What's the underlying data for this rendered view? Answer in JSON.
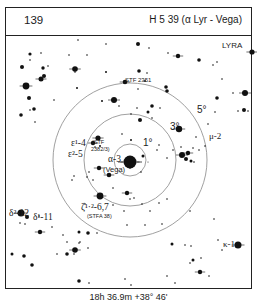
{
  "header": {
    "chart_number": "139",
    "title": "H 5 39 (α Lyr - Vega)"
  },
  "map": {
    "constellation": "LYRA",
    "center": {
      "x": 130,
      "y": 160
    },
    "rings": [
      {
        "label": "1°",
        "radius": 16,
        "label_x": 143,
        "label_y": 146
      },
      {
        "label": "3°",
        "radius": 46,
        "label_x": 170,
        "label_y": 130
      },
      {
        "label": "5°",
        "radius": 77,
        "label_x": 197,
        "label_y": 113
      }
    ],
    "labels": [
      {
        "id": "alpha",
        "text": "α-3",
        "x": 108,
        "y": 162
      },
      {
        "id": "vega",
        "text": "(Vega)",
        "x": 103,
        "y": 172
      },
      {
        "id": "stf2351",
        "text": "STF 2351",
        "x": 125,
        "y": 82
      },
      {
        "id": "eps1",
        "text": "ε¹-4",
        "x": 71,
        "y": 146
      },
      {
        "id": "eps2",
        "text": "ε²-5",
        "x": 68,
        "y": 157
      },
      {
        "id": "stf2382",
        "text": "(STF",
        "x": 92,
        "y": 144
      },
      {
        "id": "stf2382b",
        "text": "2382/3)",
        "x": 91,
        "y": 151
      },
      {
        "id": "zeta",
        "text": "ζ¹·²-6,7",
        "x": 81,
        "y": 210
      },
      {
        "id": "stfa38",
        "text": "(STFA 38)",
        "x": 87,
        "y": 218
      },
      {
        "id": "delta2",
        "text": "δ²-12",
        "x": 9,
        "y": 216
      },
      {
        "id": "delta1",
        "text": "δ¹-11",
        "x": 33,
        "y": 220
      },
      {
        "id": "mu",
        "text": "μ-2",
        "x": 209,
        "y": 139
      },
      {
        "id": "kappa",
        "text": "κ-1",
        "x": 223,
        "y": 247
      }
    ],
    "stars": [
      [
        30,
        54,
        1.6
      ],
      [
        22,
        67,
        2
      ],
      [
        43,
        68,
        1.7
      ],
      [
        30,
        60,
        0.8
      ],
      [
        41,
        53,
        0.8
      ],
      [
        48,
        66,
        0.8
      ],
      [
        26,
        86,
        3.4
      ],
      [
        41,
        79,
        2.5
      ],
      [
        44,
        76,
        2
      ],
      [
        29,
        98,
        2
      ],
      [
        34,
        109,
        1.8
      ],
      [
        54,
        100,
        0.8
      ],
      [
        30,
        110,
        0.8
      ],
      [
        21,
        115,
        1.8
      ],
      [
        35,
        122,
        0.8
      ],
      [
        69,
        55,
        0.8
      ],
      [
        75,
        69,
        2.8
      ],
      [
        75,
        72,
        0.8
      ],
      [
        87,
        55,
        0.8
      ],
      [
        106,
        44,
        0.8
      ],
      [
        77,
        88,
        1
      ],
      [
        106,
        72,
        1
      ],
      [
        102,
        101,
        1
      ],
      [
        78,
        40,
        0.8
      ],
      [
        138,
        44,
        2
      ],
      [
        149,
        48,
        0.8
      ],
      [
        168,
        53,
        0.8
      ],
      [
        178,
        56,
        2.2
      ],
      [
        177,
        56,
        0.8
      ],
      [
        139,
        71,
        1.8
      ],
      [
        147,
        73,
        0.8
      ],
      [
        145,
        81,
        1
      ],
      [
        125,
        82,
        2.3
      ],
      [
        166,
        87,
        1.8
      ],
      [
        167,
        91,
        1.8
      ],
      [
        114,
        100,
        3
      ],
      [
        119,
        106,
        0.8
      ],
      [
        138,
        89,
        0.8
      ],
      [
        152,
        106,
        1.8
      ],
      [
        160,
        108,
        0.8
      ],
      [
        137,
        108,
        0.8
      ],
      [
        148,
        112,
        1.5
      ],
      [
        152,
        118,
        0.8
      ],
      [
        199,
        60,
        1.8
      ],
      [
        213,
        65,
        0.8
      ],
      [
        222,
        79,
        0.8
      ],
      [
        217,
        62,
        0.8
      ],
      [
        217,
        98,
        1.8
      ],
      [
        233,
        93,
        0.8
      ],
      [
        245,
        93,
        3
      ],
      [
        238,
        111,
        0.8
      ],
      [
        244,
        110,
        2
      ],
      [
        248,
        111,
        0.8
      ],
      [
        215,
        112,
        0.8
      ],
      [
        208,
        124,
        0.8
      ],
      [
        252,
        52,
        2.6
      ],
      [
        98,
        138,
        2.6
      ],
      [
        93,
        143,
        2.2
      ],
      [
        100,
        146,
        1
      ],
      [
        95,
        147,
        0.8
      ],
      [
        99,
        168,
        2.2
      ],
      [
        93,
        180,
        0.8
      ],
      [
        122,
        134,
        0.8
      ],
      [
        140,
        120,
        2
      ],
      [
        131,
        114,
        0.8
      ],
      [
        131,
        140,
        1
      ],
      [
        143,
        156,
        1.5
      ],
      [
        130,
        162,
        6.5
      ],
      [
        130,
        168,
        0.8
      ],
      [
        148,
        162,
        0.5
      ],
      [
        141,
        172,
        0.8
      ],
      [
        109,
        175,
        2.3
      ],
      [
        89,
        172,
        0.8
      ],
      [
        87,
        177,
        0.8
      ],
      [
        74,
        176,
        0.8
      ],
      [
        72,
        180,
        0.8
      ],
      [
        113,
        188,
        0.8
      ],
      [
        127,
        193,
        2.2
      ],
      [
        130,
        199,
        0.8
      ],
      [
        134,
        198,
        0.8
      ],
      [
        142,
        204,
        0.8
      ],
      [
        113,
        205,
        0.8
      ],
      [
        124,
        211,
        0.8
      ],
      [
        150,
        211,
        0.8
      ],
      [
        127,
        225,
        0.8
      ],
      [
        145,
        225,
        0.8
      ],
      [
        159,
        145,
        0.8
      ],
      [
        157,
        150,
        0.8
      ],
      [
        167,
        158,
        0.8
      ],
      [
        159,
        203,
        0.8
      ],
      [
        167,
        199,
        0.8
      ],
      [
        190,
        211,
        0.8
      ],
      [
        179,
        129,
        3.2
      ],
      [
        196,
        137,
        0.8
      ],
      [
        188,
        153,
        2.2
      ],
      [
        182,
        155,
        3
      ],
      [
        186,
        159,
        2
      ],
      [
        191,
        161,
        1.5
      ],
      [
        194,
        162,
        0.8
      ],
      [
        199,
        150,
        0.8
      ],
      [
        205,
        146,
        0.8
      ],
      [
        181,
        147,
        0.8
      ],
      [
        173,
        150,
        0.8
      ],
      [
        193,
        148,
        0.8
      ],
      [
        100,
        196,
        3.4
      ],
      [
        85,
        204,
        0.8
      ],
      [
        162,
        224,
        0.8
      ],
      [
        172,
        244,
        1.5
      ],
      [
        185,
        245,
        0.8
      ],
      [
        191,
        246,
        0.8
      ],
      [
        193,
        260,
        1.5
      ],
      [
        201,
        258,
        0.8
      ],
      [
        200,
        272,
        2.2
      ],
      [
        209,
        276,
        0.8
      ],
      [
        175,
        283,
        0.8
      ],
      [
        214,
        219,
        0.8
      ],
      [
        218,
        240,
        0.8
      ],
      [
        238,
        245,
        3.5
      ],
      [
        222,
        250,
        0.8
      ],
      [
        21,
        213,
        3.5
      ],
      [
        27,
        217,
        2
      ],
      [
        20,
        223,
        0.8
      ],
      [
        25,
        224,
        0.8
      ],
      [
        40,
        232,
        2.2
      ],
      [
        52,
        227,
        0.8
      ],
      [
        39,
        216,
        0.8
      ],
      [
        63,
        235,
        0.8
      ],
      [
        67,
        242,
        0.8
      ],
      [
        79,
        232,
        1.5
      ],
      [
        88,
        233,
        1.8
      ],
      [
        97,
        233,
        0.8
      ],
      [
        79,
        243,
        0.8
      ],
      [
        75,
        250,
        2.8
      ],
      [
        88,
        248,
        0.8
      ],
      [
        80,
        242,
        0.8
      ],
      [
        12,
        254,
        1.5
      ],
      [
        24,
        256,
        1.8
      ],
      [
        57,
        254,
        0.8
      ],
      [
        67,
        254,
        1.8
      ],
      [
        74,
        254,
        0.8
      ],
      [
        32,
        265,
        1.8
      ],
      [
        79,
        281,
        1.8
      ],
      [
        89,
        283,
        0.8
      ],
      [
        125,
        279,
        0.8
      ],
      [
        131,
        285,
        0.8
      ],
      [
        167,
        276,
        0.8
      ],
      [
        190,
        263,
        0.8
      ]
    ]
  },
  "footer": {
    "coordinates": "18h 36.9m  +38° 46'"
  }
}
